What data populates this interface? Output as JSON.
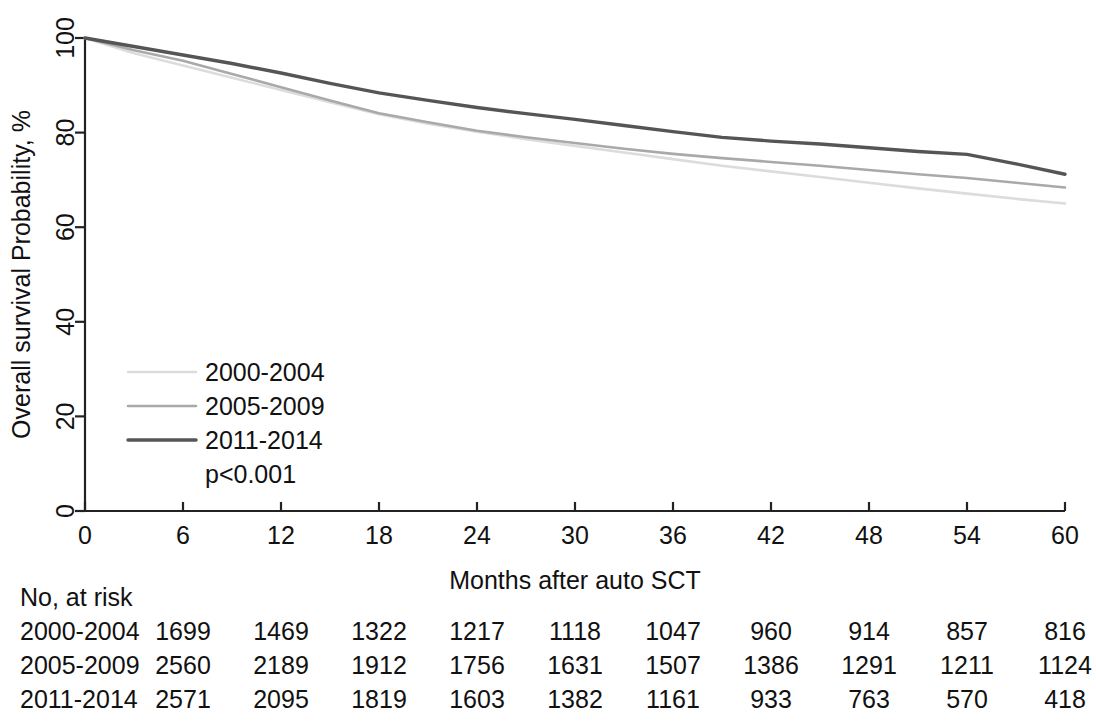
{
  "chart_data": {
    "type": "line",
    "title": "",
    "xlabel": "Months after auto SCT",
    "ylabel": "Overall survival Probability, %",
    "xlim": [
      0,
      60
    ],
    "ylim": [
      0,
      100
    ],
    "xticks": [
      0,
      6,
      12,
      18,
      24,
      30,
      36,
      42,
      48,
      54,
      60
    ],
    "yticks": [
      0,
      20,
      40,
      60,
      80,
      100
    ],
    "grid": false,
    "legend_position": "inner-left",
    "annotations": [
      "p<0.001"
    ],
    "colors": {
      "2000-2004": "#dcdcdc",
      "2005-2009": "#a9a9a9",
      "2011-2014": "#555555",
      "axis": "#222222"
    },
    "x": [
      0,
      3,
      6,
      9,
      12,
      15,
      18,
      21,
      24,
      27,
      30,
      33,
      36,
      39,
      42,
      45,
      48,
      51,
      54,
      57,
      60
    ],
    "series": [
      {
        "name": "2000-2004",
        "color": "#dcdcdc",
        "values": [
          100.0,
          96.8,
          94.2,
          91.6,
          89.0,
          86.4,
          83.9,
          81.9,
          80.2,
          78.6,
          77.2,
          75.8,
          74.4,
          73.0,
          71.8,
          70.6,
          69.4,
          68.2,
          67.1,
          66.0,
          65.0
        ]
      },
      {
        "name": "2005-2009",
        "color": "#a9a9a9",
        "values": [
          100.0,
          97.4,
          95.2,
          92.4,
          89.6,
          86.8,
          84.1,
          82.2,
          80.4,
          79.0,
          77.8,
          76.6,
          75.5,
          74.6,
          73.8,
          73.0,
          72.1,
          71.2,
          70.4,
          69.4,
          68.4
        ]
      },
      {
        "name": "2011-2014",
        "color": "#555555",
        "values": [
          100.0,
          98.2,
          96.4,
          94.6,
          92.6,
          90.4,
          88.4,
          86.8,
          85.3,
          84.0,
          82.8,
          81.5,
          80.2,
          79.0,
          78.2,
          77.6,
          76.8,
          76.0,
          75.4,
          73.4,
          71.2
        ]
      }
    ],
    "legend": [
      {
        "label": "2000-2004",
        "color": "#dcdcdc"
      },
      {
        "label": "2005-2009",
        "color": "#a9a9a9"
      },
      {
        "label": "2011-2014",
        "color": "#555555"
      }
    ],
    "pvalue": "p<0.001",
    "risk_table": {
      "header": "No, at risk",
      "time_points": [
        0,
        6,
        12,
        18,
        24,
        30,
        36,
        42,
        48,
        54,
        60
      ],
      "rows": [
        {
          "label": "2000-2004",
          "counts": [
            1699,
            1469,
            1322,
            1217,
            1118,
            1047,
            960,
            914,
            857,
            816
          ]
        },
        {
          "label": "2005-2009",
          "counts": [
            2560,
            2189,
            1912,
            1756,
            1631,
            1507,
            1386,
            1291,
            1211,
            1124
          ]
        },
        {
          "label": "2011-2014",
          "counts": [
            2571,
            2095,
            1819,
            1603,
            1382,
            1161,
            933,
            763,
            570,
            418
          ]
        }
      ]
    }
  }
}
